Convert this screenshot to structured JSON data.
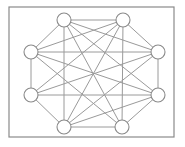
{
  "diagram": {
    "type": "graph",
    "frame": {
      "x": 9,
      "y": 7,
      "width": 165,
      "height": 130,
      "stroke": "#8a8a8a"
    },
    "node_style": {
      "radius": 7,
      "fill": "#ffffff",
      "stroke": "#8a8a8a"
    },
    "edge_style": {
      "stroke": "#9a9a9a"
    },
    "nodes": [
      {
        "id": "A",
        "x": 64,
        "y": 20
      },
      {
        "id": "B",
        "x": 123,
        "y": 20
      },
      {
        "id": "C",
        "x": 31,
        "y": 52
      },
      {
        "id": "D",
        "x": 158,
        "y": 52
      },
      {
        "id": "E",
        "x": 31,
        "y": 95
      },
      {
        "id": "F",
        "x": 158,
        "y": 95
      },
      {
        "id": "G",
        "x": 64,
        "y": 127
      },
      {
        "id": "H",
        "x": 122,
        "y": 127
      }
    ],
    "edges": [
      [
        "A",
        "B"
      ],
      [
        "A",
        "C"
      ],
      [
        "A",
        "G"
      ],
      [
        "A",
        "H"
      ],
      [
        "A",
        "F"
      ],
      [
        "A",
        "D"
      ],
      [
        "B",
        "D"
      ],
      [
        "B",
        "C"
      ],
      [
        "B",
        "E"
      ],
      [
        "B",
        "G"
      ],
      [
        "B",
        "H"
      ],
      [
        "C",
        "D"
      ],
      [
        "C",
        "E"
      ],
      [
        "C",
        "F"
      ],
      [
        "C",
        "H"
      ],
      [
        "D",
        "F"
      ],
      [
        "D",
        "E"
      ],
      [
        "D",
        "G"
      ],
      [
        "E",
        "F"
      ],
      [
        "E",
        "G"
      ],
      [
        "F",
        "G"
      ],
      [
        "F",
        "H"
      ],
      [
        "G",
        "H"
      ]
    ]
  }
}
